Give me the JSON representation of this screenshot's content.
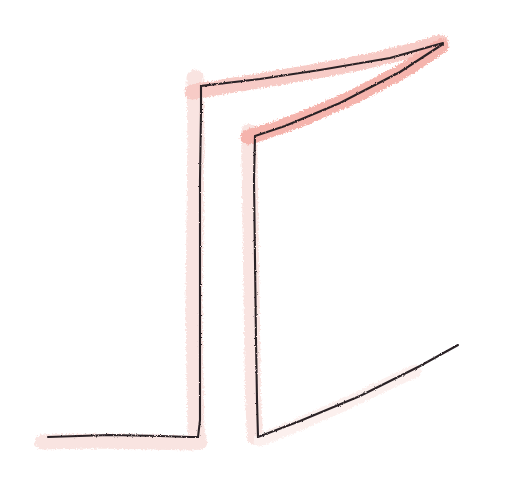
{
  "canvas": {
    "width": 508,
    "height": 486,
    "background_color": "#ffffff",
    "title": "hand-drawn sketch"
  },
  "palette": {
    "ink_color": "#2b2326",
    "highlight_strong": "#f5b1a9",
    "highlight_mid": "#f7c9c3",
    "highlight_faint": "#f9e3e0",
    "highlight_ghost": "#fcf0ee"
  },
  "strokes": {
    "ink": [
      {
        "name": "main-bracket-polyline",
        "description": "long black polyline: starts bottom-left, runs right along the floor, turns up at a tall vertical, turns right at the top, continues as a long rising diagonal to the apex",
        "width": 2.1,
        "points": "48,437 110,435 160,436 190,437 198,437 200,420 200,300 200,180 201,110 201,86 260,79 320,70 390,58 443,43"
      },
      {
        "name": "inner-bracket-polyline",
        "description": "second black polyline: from the apex down-left along a diagonal, to an elbow, then straight down a tall vertical, then out to the lower-right along a shallow rising diagonal",
        "width": 2.1,
        "points": "443,44 400,72 340,103 285,126 255,136 254,180 255,260 256,340 257,400 258,437 300,421 360,396 420,366 458,345"
      }
    ],
    "highlight": [
      {
        "name": "highlight-upper-chevron-top-edge",
        "description": "pink marker over the top horizontal/rising edge from the left elbow up to the apex",
        "width": 15,
        "color_key": "highlight_mid",
        "points": "192,92 240,84 300,74 360,63 410,51 441,42"
      },
      {
        "name": "highlight-upper-chevron-lower-edge",
        "description": "pink marker over the long inner diagonal from the apex down to the middle elbow",
        "width": 15,
        "color_key": "highlight_strong",
        "points": "441,46 405,70 355,96 305,118 268,131 248,137"
      },
      {
        "name": "highlight-left-vertical",
        "description": "faint pink wash along the tall left vertical stroke",
        "width": 17,
        "color_key": "highlight_faint",
        "points": "195,78 196,140 195,220 194,300 195,380 196,430 198,440"
      },
      {
        "name": "highlight-middle-vertical",
        "description": "faint pink wash along the tall middle vertical stroke",
        "width": 16,
        "color_key": "highlight_faint",
        "points": "249,132 250,190 251,260 252,330 253,395 255,437"
      },
      {
        "name": "highlight-bottom-left-horizontal",
        "description": "faint pink wash along the bottom-left horizontal stroke, overshooting past the left tip",
        "width": 15,
        "color_key": "highlight_faint",
        "points": "42,442 95,441 150,442 190,443 200,442"
      },
      {
        "name": "highlight-bottom-right-diagonal",
        "description": "very faint pink wash fading out along the lower-right rising diagonal",
        "width": 13,
        "color_key": "highlight_ghost",
        "points": "260,440 300,424 345,404 385,385 415,371"
      }
    ]
  }
}
